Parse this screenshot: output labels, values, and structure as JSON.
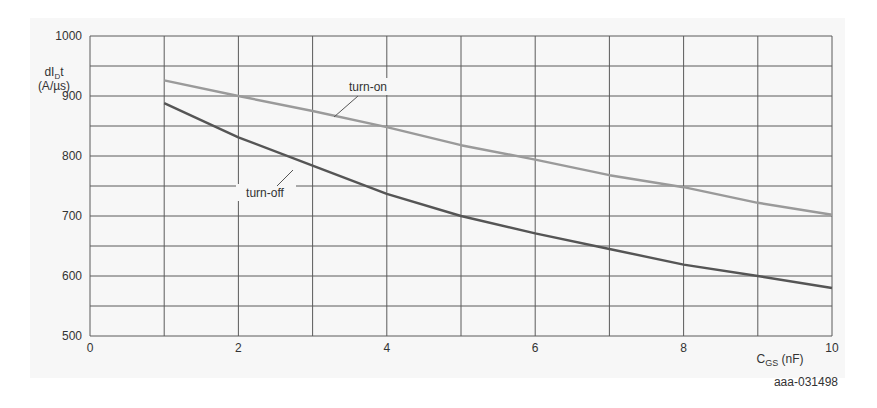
{
  "chart_data": {
    "type": "line",
    "title": "",
    "xlabel": "C_GS (nF)",
    "xlabel_main": "C",
    "xlabel_sub": "GS",
    "xlabel_unit": " (nF)",
    "ylabel_line1": "dI",
    "ylabel_sub": "D",
    "ylabel_line1_suffix": "/ t",
    "ylabel_line2": "(A/µs)",
    "ylabel": "dI/Dt (A/µs)",
    "xlim": [
      0,
      10
    ],
    "ylim": [
      500,
      1000
    ],
    "xticks": [
      "0",
      "2",
      "4",
      "6",
      "8",
      "10"
    ],
    "yticks": [
      "500",
      "600",
      "700",
      "800",
      "900",
      "1000"
    ],
    "grid": true,
    "legend": "inline annotations",
    "x": [
      1,
      2,
      3,
      4,
      5,
      6,
      7,
      8,
      9,
      10
    ],
    "series": [
      {
        "name": "turn-on",
        "color": "#9a9a9a",
        "values": [
          926,
          900,
          875,
          848,
          818,
          794,
          768,
          748,
          722,
          702
        ]
      },
      {
        "name": "turn-off",
        "color": "#555555",
        "values": [
          888,
          831,
          784,
          737,
          700,
          671,
          645,
          619,
          600,
          580
        ]
      }
    ],
    "annotations": [
      {
        "text": "turn-on",
        "series": "turn-on"
      },
      {
        "text": "turn-off",
        "series": "turn-off"
      }
    ],
    "figure_id": "aaa-031498"
  }
}
